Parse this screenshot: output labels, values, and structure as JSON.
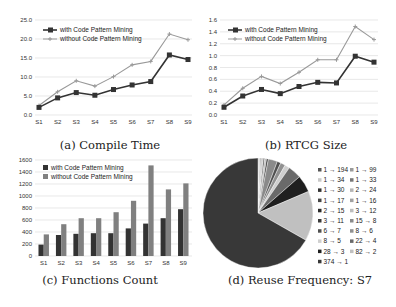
{
  "chart_data": [
    {
      "type": "line",
      "title": "(a) Compile Time",
      "categories": [
        "S1",
        "S2",
        "S3",
        "S4",
        "S5",
        "S6",
        "S7",
        "S8",
        "S9"
      ],
      "ylim": [
        0,
        25
      ],
      "yticks": [
        "0.0",
        "5.0",
        "10.0",
        "15.0",
        "20.0",
        "25.0"
      ],
      "ytick_values": [
        0,
        5,
        10,
        15,
        20,
        25
      ],
      "legend": "top-left",
      "grid": true,
      "series": [
        {
          "name": "with Code Pattern Mining",
          "color": "#333333",
          "marker": "square",
          "values": [
            2.0,
            4.5,
            5.9,
            5.2,
            6.7,
            7.9,
            8.8,
            15.8,
            14.6
          ]
        },
        {
          "name": "without Code Pattern Mining",
          "color": "#999999",
          "marker": "plus",
          "values": [
            2.5,
            6.1,
            9.0,
            7.6,
            10.1,
            13.2,
            14.1,
            21.3,
            19.8
          ]
        }
      ]
    },
    {
      "type": "line",
      "title": "(b) RTCG Size",
      "categories": [
        "S1",
        "S2",
        "S3",
        "S4",
        "S5",
        "S6",
        "S7",
        "S8",
        "S9"
      ],
      "ylim": [
        0,
        1.6
      ],
      "yticks": [
        "0.0",
        "0.2",
        "0.4",
        "0.6",
        "0.8",
        "1.0",
        "1.2",
        "1.4",
        "1.6"
      ],
      "ytick_values": [
        0,
        0.2,
        0.4,
        0.6,
        0.8,
        1.0,
        1.2,
        1.4,
        1.6
      ],
      "legend": "top-left",
      "grid": true,
      "series": [
        {
          "name": "with Code Pattern Mining",
          "color": "#333333",
          "marker": "square",
          "values": [
            0.13,
            0.32,
            0.43,
            0.36,
            0.48,
            0.55,
            0.54,
            0.99,
            0.89
          ]
        },
        {
          "name": "without Code Pattern Mining",
          "color": "#999999",
          "marker": "plus",
          "values": [
            0.17,
            0.45,
            0.65,
            0.53,
            0.72,
            0.93,
            0.93,
            1.49,
            1.27
          ]
        }
      ]
    },
    {
      "type": "bar",
      "title": "(c) Functions Count",
      "categories": [
        "S1",
        "S2",
        "S3",
        "S4",
        "S5",
        "S6",
        "S7",
        "S8",
        "S9"
      ],
      "ylim": [
        0,
        1600
      ],
      "yticks": [
        "0",
        "200",
        "400",
        "600",
        "800",
        "1000",
        "1200",
        "1400",
        "1600"
      ],
      "ytick_values": [
        0,
        200,
        400,
        600,
        800,
        1000,
        1200,
        1400,
        1600
      ],
      "legend": "top-left",
      "grid": true,
      "series": [
        {
          "name": "with Code Pattern Mining",
          "color": "#333333",
          "values": [
            190,
            350,
            370,
            380,
            380,
            460,
            540,
            630,
            780
          ]
        },
        {
          "name": "without Code Pattern Mining",
          "color": "#808080",
          "values": [
            360,
            530,
            630,
            630,
            730,
            920,
            1510,
            1110,
            1210
          ]
        }
      ]
    },
    {
      "type": "pie",
      "title": "(d) Reuse Frequency: S7",
      "legend": "right",
      "slices": [
        {
          "label": "1 → 194",
          "value": 1,
          "color": "#555555"
        },
        {
          "label": "1 → 99",
          "value": 1,
          "color": "#9a9a9a"
        },
        {
          "label": "1 → 34",
          "value": 1,
          "color": "#c8c8c8"
        },
        {
          "label": "1 → 33",
          "value": 1,
          "color": "#777777"
        },
        {
          "label": "1 → 30",
          "value": 1,
          "color": "#333333"
        },
        {
          "label": "2 → 24",
          "value": 2,
          "color": "#b5b5b5"
        },
        {
          "label": "1 → 17",
          "value": 1,
          "color": "#444444"
        },
        {
          "label": "1 → 16",
          "value": 1,
          "color": "#a0a0a0"
        },
        {
          "label": "2 → 15",
          "value": 2,
          "color": "#2a2a2a"
        },
        {
          "label": "3 → 12",
          "value": 3,
          "color": "#bdbdbd"
        },
        {
          "label": "3 → 11",
          "value": 3,
          "color": "#3a3a3a"
        },
        {
          "label": "15 → 8",
          "value": 15,
          "color": "#8a8a8a"
        },
        {
          "label": "6 → 7",
          "value": 6,
          "color": "#505050"
        },
        {
          "label": "8 → 6",
          "value": 8,
          "color": "#909090"
        },
        {
          "label": "8 → 5",
          "value": 8,
          "color": "#cfcfcf"
        },
        {
          "label": "22 → 4",
          "value": 22,
          "color": "#6a6a6a"
        },
        {
          "label": "28 → 3",
          "value": 28,
          "color": "#1f1f1f"
        },
        {
          "label": "82 → 2",
          "value": 82,
          "color": "#c0c0c0"
        },
        {
          "label": "374 → 1",
          "value": 374,
          "color": "#383838"
        }
      ]
    }
  ]
}
